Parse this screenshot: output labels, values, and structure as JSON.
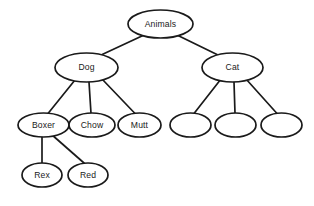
{
  "diagram": {
    "type": "tree",
    "background_color": "#ffffff",
    "stroke_color": "#1a1a1a",
    "node_fill_color": "#ffffff"
  },
  "nodes": [
    {
      "id": "animals",
      "label": "Animals",
      "cx": 160.5,
      "cy": 24,
      "rx": 32.5,
      "ry": 14,
      "level": 0,
      "empty": false
    },
    {
      "id": "dog",
      "label": "Dog",
      "cx": 86.5,
      "cy": 67.5,
      "rx": 31.5,
      "ry": 14.5,
      "level": 1,
      "empty": false
    },
    {
      "id": "cat",
      "label": "Cat",
      "cx": 232.5,
      "cy": 67.5,
      "rx": 30.5,
      "ry": 14.5,
      "level": 1,
      "empty": false
    },
    {
      "id": "boxer",
      "label": "Boxer",
      "cx": 43.5,
      "cy": 125,
      "rx": 25.5,
      "ry": 12,
      "level": 2,
      "empty": false
    },
    {
      "id": "chow",
      "label": "Chow",
      "cx": 92,
      "cy": 125,
      "rx": 23,
      "ry": 12,
      "level": 2,
      "empty": false
    },
    {
      "id": "mutt",
      "label": "Mutt",
      "cx": 139.5,
      "cy": 125,
      "rx": 21.5,
      "ry": 12,
      "level": 2,
      "empty": false
    },
    {
      "id": "cat-child-1",
      "label": "",
      "cx": 190.5,
      "cy": 125,
      "rx": 20.5,
      "ry": 12,
      "level": 2,
      "empty": true
    },
    {
      "id": "cat-child-2",
      "label": "",
      "cx": 235.5,
      "cy": 125,
      "rx": 20.5,
      "ry": 12,
      "level": 2,
      "empty": true
    },
    {
      "id": "cat-child-3",
      "label": "",
      "cx": 281.5,
      "cy": 125,
      "rx": 20.5,
      "ry": 12,
      "level": 2,
      "empty": true
    },
    {
      "id": "rex",
      "label": "Rex",
      "cx": 42,
      "cy": 175,
      "rx": 20,
      "ry": 12,
      "level": 3,
      "empty": false
    },
    {
      "id": "red",
      "label": "Red",
      "cx": 88,
      "cy": 175,
      "rx": 20,
      "ry": 12,
      "level": 3,
      "empty": false
    }
  ],
  "edges": [
    {
      "id": "animals-dog",
      "from": "animals",
      "to": "dog",
      "x1": 143,
      "y1": 35.5,
      "x2": 100,
      "y2": 55.5
    },
    {
      "id": "animals-cat",
      "from": "animals",
      "to": "cat",
      "x1": 178,
      "y1": 35.5,
      "x2": 219,
      "y2": 55.5
    },
    {
      "id": "dog-boxer",
      "from": "dog",
      "to": "boxer",
      "x1": 75,
      "y1": 80,
      "x2": 48,
      "y2": 113.5
    },
    {
      "id": "dog-chow",
      "from": "dog",
      "to": "chow",
      "x1": 89,
      "y1": 82,
      "x2": 91,
      "y2": 113.5
    },
    {
      "id": "dog-mutt",
      "from": "dog",
      "to": "mutt",
      "x1": 102,
      "y1": 79,
      "x2": 135,
      "y2": 113.5
    },
    {
      "id": "cat-child1",
      "from": "cat",
      "to": "cat-child-1",
      "x1": 221,
      "y1": 79,
      "x2": 194,
      "y2": 113.5
    },
    {
      "id": "cat-child2",
      "from": "cat",
      "to": "cat-child-2",
      "x1": 234,
      "y1": 82,
      "x2": 235,
      "y2": 113.5
    },
    {
      "id": "cat-child3",
      "from": "cat",
      "to": "cat-child-3",
      "x1": 246,
      "y1": 79,
      "x2": 277,
      "y2": 113.5
    },
    {
      "id": "boxer-rex",
      "from": "boxer",
      "to": "rex",
      "x1": 42,
      "y1": 137,
      "x2": 42,
      "y2": 163
    },
    {
      "id": "boxer-red",
      "from": "boxer",
      "to": "red",
      "x1": 51,
      "y1": 134,
      "x2": 84,
      "y2": 163
    }
  ]
}
